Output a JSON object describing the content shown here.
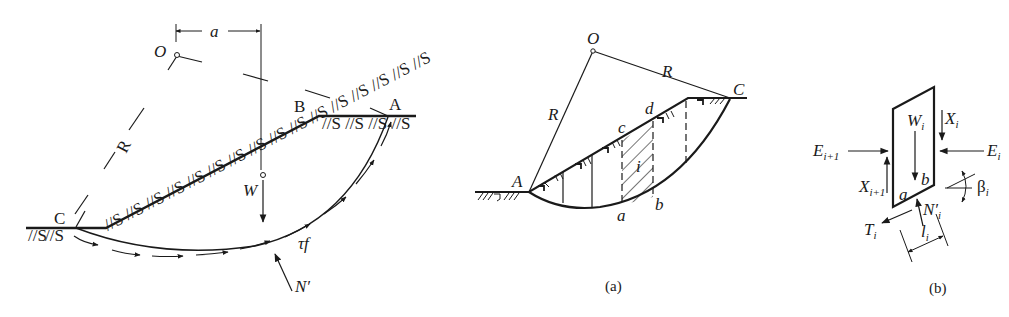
{
  "figure_left": {
    "title": "Circular slip surface with weight and shear resistance",
    "labels": {
      "O": "O",
      "a": "a",
      "R": "R",
      "A": "A",
      "B": "B",
      "C": "C",
      "W": "W",
      "tau_f": "τf",
      "N_prime": "N′"
    },
    "hatch_text": "//S"
  },
  "figure_a": {
    "caption": "(a)",
    "labels": {
      "O": "O",
      "R_left": "R",
      "R_right": "R",
      "A": "A",
      "C": "C",
      "a": "a",
      "b": "b",
      "c": "c",
      "d": "d",
      "i": "i"
    }
  },
  "figure_b": {
    "caption": "(b)",
    "labels": {
      "W": "W",
      "W_sub": "i",
      "X_right": "X",
      "X_right_sub": "i",
      "X_left": "X",
      "X_left_sub": "i+1",
      "E_left": "E",
      "E_left_sub": "i+1",
      "E_right": "E",
      "E_right_sub": "i",
      "a": "a",
      "b": "b",
      "N": "N′",
      "N_sub": "i",
      "T": "T",
      "T_sub": "i",
      "l": "l",
      "l_sub": "i",
      "beta": "β",
      "beta_sub": "i"
    }
  },
  "colors": {
    "ink": "#1a1a1a",
    "background": "#ffffff"
  }
}
